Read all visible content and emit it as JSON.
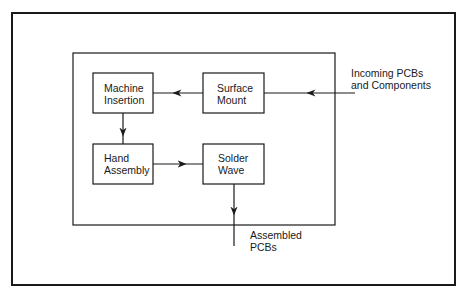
{
  "diagram": {
    "type": "process-flow",
    "nodes": [
      {
        "id": "machine_insertion",
        "line1": "Machine",
        "line2": "Insertion"
      },
      {
        "id": "surface_mount",
        "line1": "Surface",
        "line2": "Mount"
      },
      {
        "id": "hand_assembly",
        "line1": "Hand",
        "line2": "Assembly"
      },
      {
        "id": "solder_wave",
        "line1": "Solder",
        "line2": "Wave"
      }
    ],
    "edges": [
      {
        "from": "input",
        "to": "surface_mount"
      },
      {
        "from": "surface_mount",
        "to": "machine_insertion"
      },
      {
        "from": "machine_insertion",
        "to": "hand_assembly"
      },
      {
        "from": "hand_assembly",
        "to": "solder_wave"
      },
      {
        "from": "solder_wave",
        "to": "output"
      }
    ],
    "input_label": {
      "line1": "Incoming PCBs",
      "line2": "and Components"
    },
    "output_label": {
      "line1": "Assembled",
      "line2": "PCBs"
    },
    "colors": {
      "stroke": "#1a1a1a",
      "background": "#ffffff"
    }
  }
}
